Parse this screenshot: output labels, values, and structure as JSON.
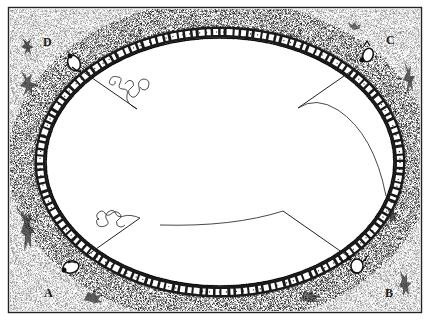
{
  "diagram": {
    "type": "illustration",
    "frame": {
      "x": 8,
      "y": 7,
      "width": 414,
      "height": 306,
      "stroke": "#222222"
    },
    "ring": {
      "cx": 220,
      "cy": 162,
      "rx": 180,
      "ry": 130,
      "stone_color": "#1a1a1a",
      "stipple_color": "#333333"
    },
    "corners": [
      {
        "id": "A",
        "label": "A",
        "label_pos": [
          45,
          293
        ],
        "figure_pos": [
          70,
          266
        ],
        "line_from": [
          86,
          256
        ],
        "line_to": [
          140,
          218
        ],
        "trail": "squiggle"
      },
      {
        "id": "B",
        "label": "B",
        "label_pos": [
          387,
          293
        ],
        "figure_pos": [
          356,
          267
        ],
        "line_from": [
          346,
          254
        ],
        "line_to": [
          283,
          211
        ],
        "trail": "arc-to-left"
      },
      {
        "id": "C",
        "label": "C",
        "label_pos": [
          389,
          44
        ],
        "figure_pos": [
          367,
          54
        ],
        "line_from": [
          355,
          68
        ],
        "line_to": [
          298,
          108
        ],
        "trail": "long-arc"
      },
      {
        "id": "D",
        "label": "D",
        "label_pos": [
          46,
          45
        ],
        "figure_pos": [
          72,
          60
        ],
        "line_from": [
          83,
          72
        ],
        "line_to": [
          137,
          109
        ],
        "trail": "squiggle"
      }
    ]
  }
}
